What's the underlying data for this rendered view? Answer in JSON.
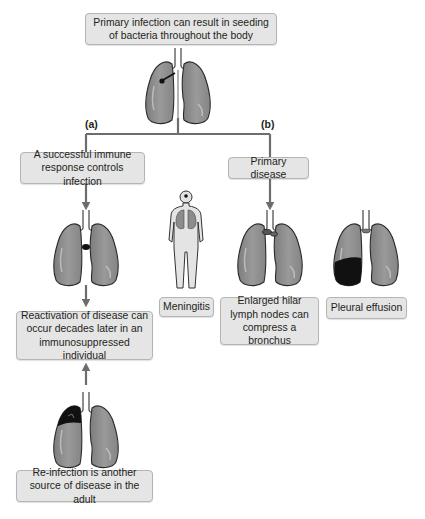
{
  "top": {
    "text": "Primary infection can result in seeding of bacteria throughout the body"
  },
  "branches": {
    "a_label": "(a)",
    "b_label": "(b)"
  },
  "branch_a": {
    "immune_text": "A successful immune response controls infection",
    "reactivation_text": "Reactivation of disease can occur decades later in an immunosuppressed individual",
    "reinfection_text": "Re-infection is another source of disease in the adult"
  },
  "branch_b": {
    "primary_text": "Primary disease",
    "outcomes": [
      {
        "label": "Meningitis",
        "icon": "human-figure-icon"
      },
      {
        "label": "Enlarged hilar lymph nodes can compress a bronchus",
        "icon": "lungs-hilar-nodes-icon"
      },
      {
        "label": "Pleural effusion",
        "icon": "lungs-pleural-effusion-icon"
      }
    ]
  },
  "colors": {
    "box_fill": "#e5e5e5",
    "box_border": "#b5b5b5",
    "lung_fill": "#8f8f8f",
    "lung_outline": "#2b2b2b",
    "arrow": "#6d6d6d",
    "lesion": "#111111"
  }
}
